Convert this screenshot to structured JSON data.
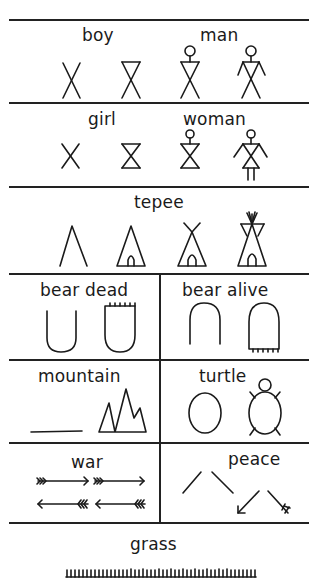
{
  "sections": [
    {
      "id": "boy-man",
      "labels": {
        "boy": "boy",
        "man": "man"
      }
    },
    {
      "id": "girl-woman",
      "labels": {
        "girl": "girl",
        "woman": "woman"
      }
    },
    {
      "id": "tepee",
      "labels": {
        "tepee": "tepee"
      }
    },
    {
      "id": "bear",
      "labels": {
        "bear_dead": "bear dead",
        "bear_alive": "bear alive"
      }
    },
    {
      "id": "mountain-turtle",
      "labels": {
        "mountain": "mountain",
        "turtle": "turtle"
      }
    },
    {
      "id": "war-peace",
      "labels": {
        "war": "war",
        "peace": "peace"
      }
    },
    {
      "id": "grass",
      "labels": {
        "grass": "grass"
      }
    }
  ],
  "colors": {
    "ink": "#1a1a1a",
    "background": "#ffffff"
  }
}
